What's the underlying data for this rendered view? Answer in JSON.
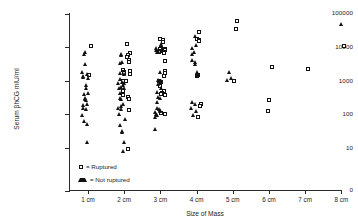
{
  "chart_data": {
    "type": "scatter",
    "title": "",
    "xlabel": "Size of Mass",
    "ylabel": "Serum βhCG mIU/ml",
    "yscale": "log",
    "ytick_labels": [
      "100000",
      "10000",
      "1000",
      "100",
      "10",
      "0"
    ],
    "ytick_values": [
      100000,
      10000,
      1000,
      100,
      10,
      0
    ],
    "categories": [
      "1 cm",
      "2 cm",
      "3 cm",
      "4 cm",
      "5 cm",
      "6 cm",
      "7 cm",
      "8 cm"
    ],
    "grid": false,
    "legend_position": "inside-lower-left",
    "series": [
      {
        "name": "Ruptured",
        "marker": "open-square",
        "points": [
          {
            "category": "1 cm",
            "value": 11000
          },
          {
            "category": "1 cm",
            "value": 1500
          },
          {
            "category": "2 cm",
            "value": 12000
          },
          {
            "category": "2 cm",
            "value": 6500
          },
          {
            "category": "2 cm",
            "value": 6000
          },
          {
            "category": "2 cm",
            "value": 5200
          },
          {
            "category": "2 cm",
            "value": 4000
          },
          {
            "category": "2 cm",
            "value": 3600
          },
          {
            "category": "2 cm",
            "value": 2100
          },
          {
            "category": "2 cm",
            "value": 1900
          },
          {
            "category": "2 cm",
            "value": 1800
          },
          {
            "category": "2 cm",
            "value": 1700
          },
          {
            "category": "2 cm",
            "value": 1600
          },
          {
            "category": "2 cm",
            "value": 1000
          },
          {
            "category": "2 cm",
            "value": 950
          },
          {
            "category": "2 cm",
            "value": 500
          },
          {
            "category": "2 cm",
            "value": 380
          },
          {
            "category": "2 cm",
            "value": 330
          },
          {
            "category": "2 cm",
            "value": 290
          },
          {
            "category": "2 cm",
            "value": 130
          },
          {
            "category": "2 cm",
            "value": 9
          },
          {
            "category": "3 cm",
            "value": 17000
          },
          {
            "category": "3 cm",
            "value": 16000
          },
          {
            "category": "3 cm",
            "value": 14000
          },
          {
            "category": "3 cm",
            "value": 9500
          },
          {
            "category": "3 cm",
            "value": 9000
          },
          {
            "category": "3 cm",
            "value": 8500
          },
          {
            "category": "3 cm",
            "value": 8000
          },
          {
            "category": "3 cm",
            "value": 7600
          },
          {
            "category": "3 cm",
            "value": 7200
          },
          {
            "category": "3 cm",
            "value": 7000
          },
          {
            "category": "3 cm",
            "value": 6900
          },
          {
            "category": "3 cm",
            "value": 3800
          },
          {
            "category": "3 cm",
            "value": 1900
          },
          {
            "category": "3 cm",
            "value": 1700
          },
          {
            "category": "3 cm",
            "value": 1400
          },
          {
            "category": "3 cm",
            "value": 1000
          },
          {
            "category": "3 cm",
            "value": 900
          },
          {
            "category": "3 cm",
            "value": 700
          },
          {
            "category": "3 cm",
            "value": 500
          },
          {
            "category": "3 cm",
            "value": 430
          },
          {
            "category": "3 cm",
            "value": 400
          },
          {
            "category": "3 cm",
            "value": 380
          },
          {
            "category": "3 cm",
            "value": 110
          },
          {
            "category": "3 cm",
            "value": 100
          },
          {
            "category": "4 cm",
            "value": 28000
          },
          {
            "category": "4 cm",
            "value": 18000
          },
          {
            "category": "4 cm",
            "value": 16000
          },
          {
            "category": "4 cm",
            "value": 15000
          },
          {
            "category": "4 cm",
            "value": 1500
          },
          {
            "category": "4 cm",
            "value": 1400
          },
          {
            "category": "4 cm",
            "value": 200
          },
          {
            "category": "4 cm",
            "value": 180
          },
          {
            "category": "4 cm",
            "value": 85
          },
          {
            "category": "5 cm",
            "value": 60000
          },
          {
            "category": "5 cm",
            "value": 34000
          },
          {
            "category": "5 cm",
            "value": 1000
          },
          {
            "category": "6 cm",
            "value": 2600
          },
          {
            "category": "6 cm",
            "value": 270
          },
          {
            "category": "6 cm",
            "value": 125
          },
          {
            "category": "7 cm",
            "value": 2200
          },
          {
            "category": "8 cm",
            "value": 11000
          }
        ]
      },
      {
        "name": "Not ruptured",
        "marker": "filled-triangle",
        "points": [
          {
            "category": "1 cm",
            "value": 7000
          },
          {
            "category": "1 cm",
            "value": 6000
          },
          {
            "category": "1 cm",
            "value": 3000
          },
          {
            "category": "1 cm",
            "value": 1700
          },
          {
            "category": "1 cm",
            "value": 1500
          },
          {
            "category": "1 cm",
            "value": 1300
          },
          {
            "category": "1 cm",
            "value": 1250
          },
          {
            "category": "1 cm",
            "value": 1200
          },
          {
            "category": "1 cm",
            "value": 700
          },
          {
            "category": "1 cm",
            "value": 600
          },
          {
            "category": "1 cm",
            "value": 430
          },
          {
            "category": "1 cm",
            "value": 400
          },
          {
            "category": "1 cm",
            "value": 300
          },
          {
            "category": "1 cm",
            "value": 280
          },
          {
            "category": "1 cm",
            "value": 250
          },
          {
            "category": "1 cm",
            "value": 200
          },
          {
            "category": "1 cm",
            "value": 180
          },
          {
            "category": "1 cm",
            "value": 150
          },
          {
            "category": "1 cm",
            "value": 140
          },
          {
            "category": "1 cm",
            "value": 90
          },
          {
            "category": "1 cm",
            "value": 60
          },
          {
            "category": "1 cm",
            "value": 50
          },
          {
            "category": "1 cm",
            "value": 14
          },
          {
            "category": "2 cm",
            "value": 6000
          },
          {
            "category": "2 cm",
            "value": 5500
          },
          {
            "category": "2 cm",
            "value": 3500
          },
          {
            "category": "2 cm",
            "value": 3300
          },
          {
            "category": "2 cm",
            "value": 1600
          },
          {
            "category": "2 cm",
            "value": 1500
          },
          {
            "category": "2 cm",
            "value": 1100
          },
          {
            "category": "2 cm",
            "value": 900
          },
          {
            "category": "2 cm",
            "value": 850
          },
          {
            "category": "2 cm",
            "value": 800
          },
          {
            "category": "2 cm",
            "value": 700
          },
          {
            "category": "2 cm",
            "value": 620
          },
          {
            "category": "2 cm",
            "value": 600
          },
          {
            "category": "2 cm",
            "value": 590
          },
          {
            "category": "2 cm",
            "value": 420
          },
          {
            "category": "2 cm",
            "value": 300
          },
          {
            "category": "2 cm",
            "value": 280
          },
          {
            "category": "2 cm",
            "value": 200
          },
          {
            "category": "2 cm",
            "value": 170
          },
          {
            "category": "2 cm",
            "value": 150
          },
          {
            "category": "2 cm",
            "value": 140
          },
          {
            "category": "2 cm",
            "value": 100
          },
          {
            "category": "2 cm",
            "value": 70
          },
          {
            "category": "2 cm",
            "value": 45
          },
          {
            "category": "2 cm",
            "value": 30
          },
          {
            "category": "2 cm",
            "value": 28
          },
          {
            "category": "2 cm",
            "value": 14
          },
          {
            "category": "2 cm",
            "value": 8
          },
          {
            "category": "3 cm",
            "value": 12000
          },
          {
            "category": "3 cm",
            "value": 9000
          },
          {
            "category": "3 cm",
            "value": 8000
          },
          {
            "category": "3 cm",
            "value": 7500
          },
          {
            "category": "3 cm",
            "value": 7000
          },
          {
            "category": "3 cm",
            "value": 1800
          },
          {
            "category": "3 cm",
            "value": 1000
          },
          {
            "category": "3 cm",
            "value": 950
          },
          {
            "category": "3 cm",
            "value": 800
          },
          {
            "category": "3 cm",
            "value": 750
          },
          {
            "category": "3 cm",
            "value": 600
          },
          {
            "category": "3 cm",
            "value": 450
          },
          {
            "category": "3 cm",
            "value": 320
          },
          {
            "category": "3 cm",
            "value": 300
          },
          {
            "category": "3 cm",
            "value": 230
          },
          {
            "category": "3 cm",
            "value": 150
          },
          {
            "category": "3 cm",
            "value": 140
          },
          {
            "category": "3 cm",
            "value": 130
          },
          {
            "category": "3 cm",
            "value": 120
          },
          {
            "category": "3 cm",
            "value": 110
          },
          {
            "category": "3 cm",
            "value": 100
          },
          {
            "category": "3 cm",
            "value": 90
          },
          {
            "category": "3 cm",
            "value": 80
          },
          {
            "category": "3 cm",
            "value": 35
          },
          {
            "category": "4 cm",
            "value": 20000
          },
          {
            "category": "4 cm",
            "value": 11000
          },
          {
            "category": "4 cm",
            "value": 9000
          },
          {
            "category": "4 cm",
            "value": 7000
          },
          {
            "category": "4 cm",
            "value": 6000
          },
          {
            "category": "4 cm",
            "value": 4000
          },
          {
            "category": "4 cm",
            "value": 3500
          },
          {
            "category": "4 cm",
            "value": 3000
          },
          {
            "category": "4 cm",
            "value": 1700
          },
          {
            "category": "4 cm",
            "value": 1400
          },
          {
            "category": "4 cm",
            "value": 230
          },
          {
            "category": "4 cm",
            "value": 200
          },
          {
            "category": "4 cm",
            "value": 150
          },
          {
            "category": "4 cm",
            "value": 120
          },
          {
            "category": "4 cm",
            "value": 90
          },
          {
            "category": "5 cm",
            "value": 1800
          },
          {
            "category": "5 cm",
            "value": 1200
          },
          {
            "category": "5 cm",
            "value": 1000
          },
          {
            "category": "8 cm",
            "value": 48000
          }
        ]
      }
    ]
  },
  "legend": {
    "items": [
      {
        "label": "= Ruptured",
        "marker": "open-square"
      },
      {
        "label": "= Not ruptured",
        "marker": "filled-triangle"
      }
    ]
  }
}
